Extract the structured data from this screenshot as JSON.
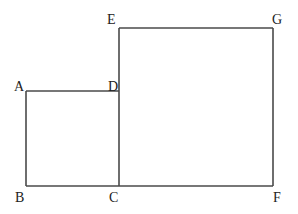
{
  "diagram": {
    "stroke_color": "#4a4a4a",
    "label_color": "#222222",
    "points": {
      "A": {
        "x": 26,
        "y": 91
      },
      "B": {
        "x": 26,
        "y": 186
      },
      "C": {
        "x": 119,
        "y": 186
      },
      "D": {
        "x": 119,
        "y": 91
      },
      "E": {
        "x": 119,
        "y": 28
      },
      "G": {
        "x": 273,
        "y": 28
      },
      "F": {
        "x": 273,
        "y": 186
      }
    },
    "labels": {
      "A": "A",
      "B": "B",
      "C": "C",
      "D": "D",
      "E": "E",
      "F": "F",
      "G": "G"
    },
    "shapes": [
      {
        "name": "small-square",
        "vertices": [
          "A",
          "B",
          "C",
          "D"
        ]
      },
      {
        "name": "large-square",
        "vertices": [
          "E",
          "C",
          "F",
          "G"
        ]
      }
    ]
  }
}
